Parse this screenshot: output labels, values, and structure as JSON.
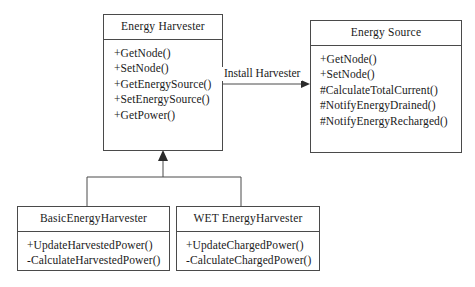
{
  "diagram": {
    "type": "uml-class-diagram",
    "background_color": "#ffffff",
    "line_color": "#4a4a4a",
    "text_color": "#1a1a1a",
    "classes": [
      {
        "id": "energy-harvester",
        "name": "Energy Harvester",
        "members": [
          "+GetNode()",
          "+SetNode()",
          "+GetEnergySource()",
          "+SetEnergySource()",
          "+GetPower()"
        ]
      },
      {
        "id": "energy-source",
        "name": "Energy Source",
        "members": [
          "+GetNode()",
          "+SetNode()",
          "#CalculateTotalCurrent()",
          "#NotifyEnergyDrained()",
          "#NotifyEnergyRecharged()"
        ]
      },
      {
        "id": "basic-energy-harvester",
        "name": "BasicEnergyHarvester",
        "members": [
          "+UpdateHarvestedPower()",
          "-CalculateHarvestedPower()"
        ]
      },
      {
        "id": "wet-energy-harvester",
        "name": "WET EnergyHarvester",
        "members": [
          "+UpdateChargedPower()",
          "-CalculateChargedPower()"
        ]
      }
    ],
    "relationships": [
      {
        "id": "install-harvester",
        "kind": "association",
        "label": "Install Harvester",
        "from": "energy-harvester",
        "to": "energy-source",
        "arrow": "filled-arrow"
      },
      {
        "id": "basic-generalization",
        "kind": "generalization",
        "label": "",
        "from": "basic-energy-harvester",
        "to": "energy-harvester",
        "arrow": "filled-triangle"
      },
      {
        "id": "wet-generalization",
        "kind": "generalization",
        "label": "",
        "from": "wet-energy-harvester",
        "to": "energy-harvester",
        "arrow": "filled-triangle"
      }
    ]
  }
}
